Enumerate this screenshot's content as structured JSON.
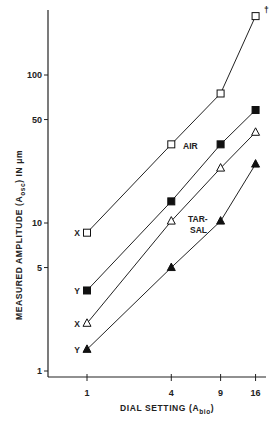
{
  "chart_data": {
    "type": "line",
    "title": "",
    "xlabel": "DIAL SETTING (A_bio)",
    "xlabel_main": "DIAL SETTING (A",
    "xlabel_sub": "bio",
    "xlabel_close": ")",
    "ylabel": "MEASURED AMPLITUDE (A_osc) IN μm",
    "ylabel_part1": "MEASURED AMPLITUDE (A",
    "ylabel_sub": "osc",
    "ylabel_part2": ") IN μm",
    "xscale": "log",
    "yscale": "log",
    "x": [
      1,
      4,
      9,
      16
    ],
    "x_tick_labels": [
      "1",
      "4",
      "9",
      "16"
    ],
    "y_ticks": [
      1,
      5,
      10,
      50,
      100
    ],
    "y_tick_labels": [
      "1",
      "5",
      "10",
      "50",
      "100"
    ],
    "ylim": [
      1,
      270
    ],
    "xlim": [
      1,
      19
    ],
    "grid": false,
    "series": [
      {
        "name": "AIR X",
        "group": "AIR",
        "axis": "X",
        "marker": "open-square",
        "values": [
          8.6,
          34,
          75,
          250
        ],
        "note": "†"
      },
      {
        "name": "AIR Y",
        "group": "AIR",
        "axis": "Y",
        "marker": "filled-square",
        "values": [
          3.5,
          14,
          34,
          58
        ]
      },
      {
        "name": "TARSAL X",
        "group": "TARSAL",
        "axis": "X",
        "marker": "open-triangle",
        "values": [
          2.1,
          10.3,
          23.5,
          41
        ]
      },
      {
        "name": "TARSAL Y",
        "group": "TARSAL",
        "axis": "Y",
        "marker": "filled-triangle",
        "values": [
          1.4,
          5.0,
          10.3,
          25
        ]
      }
    ],
    "annotations": {
      "air": "AIR",
      "tarsal_line1": "TAR-",
      "tarsal_line2": "SAL",
      "dagger": "†",
      "series_labels": [
        "X",
        "Y",
        "X",
        "Y"
      ]
    }
  }
}
